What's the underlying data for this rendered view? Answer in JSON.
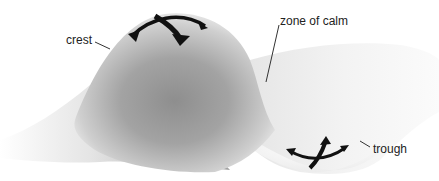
{
  "diagram": {
    "type": "wave surface illustration",
    "labels": {
      "crest": "crest",
      "zone_of_calm": "zone of calm",
      "trough": "trough"
    },
    "colors": {
      "background": "#ffffff",
      "surface_dark": "#8a8a8a",
      "surface_light": "#f2f2f2",
      "arrow": "#111111",
      "leader_line": "#333333",
      "text": "#222222"
    }
  }
}
